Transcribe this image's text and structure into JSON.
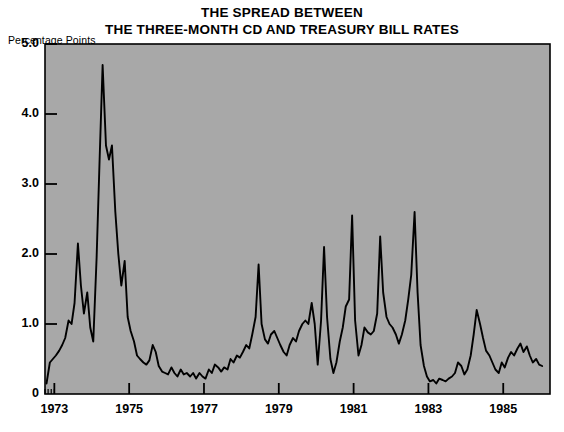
{
  "chart_data": {
    "type": "line",
    "title": "THE SPREAD BETWEEN THE THREE-MONTH CD AND TREASURY BILL RATES",
    "title_line1": "THE SPREAD BETWEEN",
    "title_line2": "THE THREE-MONTH CD AND TREASURY BILL RATES",
    "ylabel": "Percentage Points",
    "xlabel": "",
    "ylim": [
      0,
      5.0
    ],
    "xlim": [
      1972.75,
      1986.25
    ],
    "grid": false,
    "legend": null,
    "series_name": "CD minus Treasury bill spread",
    "line_color": "#000000",
    "plot_background": "#a8a8a8",
    "page_background": "#ffffff",
    "ytick_labels": [
      "5.0",
      "4.0",
      "3.0",
      "2.0",
      "1.0",
      "0"
    ],
    "ytick_values": [
      5.0,
      4.0,
      3.0,
      2.0,
      1.0,
      0
    ],
    "xtick_labels": [
      "1973",
      "1975",
      "1977",
      "1979",
      "1981",
      "1983",
      "1985"
    ],
    "xtick_values": [
      1973,
      1975,
      1977,
      1979,
      1981,
      1983,
      1985
    ],
    "x": [
      1972.79,
      1972.88,
      1972.96,
      1973.04,
      1973.13,
      1973.21,
      1973.29,
      1973.38,
      1973.46,
      1973.54,
      1973.63,
      1973.71,
      1973.79,
      1973.88,
      1973.96,
      1974.04,
      1974.13,
      1974.21,
      1974.29,
      1974.38,
      1974.46,
      1974.54,
      1974.63,
      1974.71,
      1974.79,
      1974.88,
      1974.96,
      1975.04,
      1975.13,
      1975.21,
      1975.29,
      1975.38,
      1975.46,
      1975.54,
      1975.63,
      1975.71,
      1975.79,
      1975.88,
      1975.96,
      1976.04,
      1976.13,
      1976.21,
      1976.29,
      1976.38,
      1976.46,
      1976.54,
      1976.63,
      1976.71,
      1976.79,
      1976.88,
      1976.96,
      1977.04,
      1977.13,
      1977.21,
      1977.29,
      1977.38,
      1977.46,
      1977.54,
      1977.63,
      1977.71,
      1977.79,
      1977.88,
      1977.96,
      1978.04,
      1978.13,
      1978.21,
      1978.29,
      1978.38,
      1978.46,
      1978.54,
      1978.63,
      1978.71,
      1978.79,
      1978.88,
      1978.96,
      1979.04,
      1979.13,
      1979.21,
      1979.29,
      1979.38,
      1979.46,
      1979.54,
      1979.63,
      1979.71,
      1979.79,
      1979.88,
      1979.96,
      1980.04,
      1980.13,
      1980.21,
      1980.29,
      1980.38,
      1980.46,
      1980.54,
      1980.63,
      1980.71,
      1980.79,
      1980.88,
      1980.96,
      1981.04,
      1981.13,
      1981.21,
      1981.29,
      1981.38,
      1981.46,
      1981.54,
      1981.63,
      1981.71,
      1981.79,
      1981.88,
      1981.96,
      1982.04,
      1982.13,
      1982.21,
      1982.29,
      1982.38,
      1982.46,
      1982.54,
      1982.63,
      1982.71,
      1982.79,
      1982.88,
      1982.96,
      1983.04,
      1983.13,
      1983.21,
      1983.29,
      1983.38,
      1983.46,
      1983.54,
      1983.63,
      1983.71,
      1983.79,
      1983.88,
      1983.96,
      1984.04,
      1984.13,
      1984.21,
      1984.29,
      1984.38,
      1984.46,
      1984.54,
      1984.63,
      1984.71,
      1984.79,
      1984.88,
      1984.96,
      1985.04,
      1985.13,
      1985.21,
      1985.29,
      1985.38,
      1985.46,
      1985.54,
      1985.63,
      1985.71,
      1985.79,
      1985.88,
      1985.96,
      1986.04
    ],
    "values": [
      0.15,
      0.45,
      0.5,
      0.55,
      0.62,
      0.7,
      0.8,
      1.05,
      1.0,
      1.3,
      2.15,
      1.55,
      1.15,
      1.45,
      0.95,
      0.75,
      1.95,
      3.35,
      4.7,
      3.55,
      3.35,
      3.55,
      2.6,
      2.0,
      1.55,
      1.9,
      1.1,
      0.9,
      0.75,
      0.55,
      0.5,
      0.45,
      0.42,
      0.48,
      0.7,
      0.6,
      0.4,
      0.32,
      0.3,
      0.28,
      0.38,
      0.3,
      0.25,
      0.35,
      0.28,
      0.3,
      0.25,
      0.3,
      0.22,
      0.3,
      0.25,
      0.22,
      0.35,
      0.3,
      0.42,
      0.38,
      0.32,
      0.38,
      0.35,
      0.5,
      0.45,
      0.55,
      0.52,
      0.6,
      0.7,
      0.65,
      0.85,
      1.1,
      1.85,
      1.0,
      0.78,
      0.72,
      0.85,
      0.9,
      0.8,
      0.7,
      0.6,
      0.55,
      0.7,
      0.8,
      0.75,
      0.9,
      1.0,
      1.05,
      1.0,
      1.3,
      1.0,
      0.42,
      1.05,
      2.1,
      1.1,
      0.5,
      0.3,
      0.45,
      0.75,
      0.95,
      1.25,
      1.35,
      2.55,
      1.05,
      0.55,
      0.7,
      0.95,
      0.88,
      0.85,
      0.9,
      1.15,
      2.25,
      1.45,
      1.1,
      1.0,
      0.95,
      0.85,
      0.72,
      0.85,
      1.05,
      1.35,
      1.7,
      2.6,
      1.45,
      0.7,
      0.4,
      0.25,
      0.18,
      0.2,
      0.15,
      0.22,
      0.2,
      0.18,
      0.22,
      0.25,
      0.3,
      0.45,
      0.4,
      0.28,
      0.35,
      0.55,
      0.85,
      1.2,
      1.0,
      0.8,
      0.62,
      0.55,
      0.45,
      0.35,
      0.3,
      0.45,
      0.38,
      0.52,
      0.6,
      0.55,
      0.65,
      0.72,
      0.6,
      0.68,
      0.55,
      0.45,
      0.5,
      0.42,
      0.4
    ]
  }
}
